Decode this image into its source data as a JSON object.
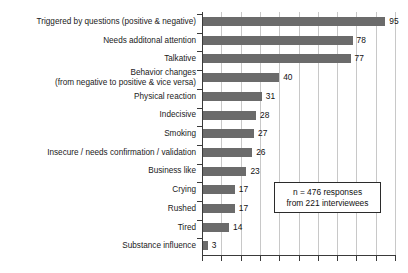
{
  "chart_data": {
    "type": "bar",
    "orientation": "horizontal",
    "title": "",
    "subtitle": "",
    "xlabel": "",
    "ylabel": "",
    "xlim": [
      0,
      100
    ],
    "grid": true,
    "gridline_interval": 10,
    "legend": "none",
    "tick_labels_x": [],
    "bar_color": "#6b6b6b",
    "categories": [
      "Triggered by questions (positive & negative)",
      "Needs additonal attention",
      "Talkative",
      "Behavior changes",
      "Physical reaction",
      "Indecisive",
      "Smoking",
      "Insecure / needs confirmation / validation",
      "Business like",
      "Crying",
      "Rushed",
      "Tired",
      "Substance influence"
    ],
    "category_lines": [
      [
        "Triggered by questions (positive & negative)"
      ],
      [
        "Needs additonal attention"
      ],
      [
        "Talkative"
      ],
      [
        "Behavior changes",
        "(from negative to positive & vice versa)"
      ],
      [
        "Physical reaction"
      ],
      [
        "Indecisive"
      ],
      [
        "Smoking"
      ],
      [
        "Insecure / needs confirmation / validation"
      ],
      [
        "Business like"
      ],
      [
        "Crying"
      ],
      [
        "Rushed"
      ],
      [
        "Tired"
      ],
      [
        "Substance influence"
      ]
    ],
    "values": [
      95,
      78,
      77,
      40,
      31,
      28,
      27,
      26,
      23,
      17,
      17,
      14,
      3
    ],
    "value_labels": [
      "95",
      "78",
      "77",
      "40",
      "31",
      "28",
      "27",
      "26",
      "23",
      "17",
      "17",
      "14",
      "3"
    ]
  },
  "annotation": {
    "line1": "n = 476 responses",
    "line2": "from 221 interviewees"
  }
}
